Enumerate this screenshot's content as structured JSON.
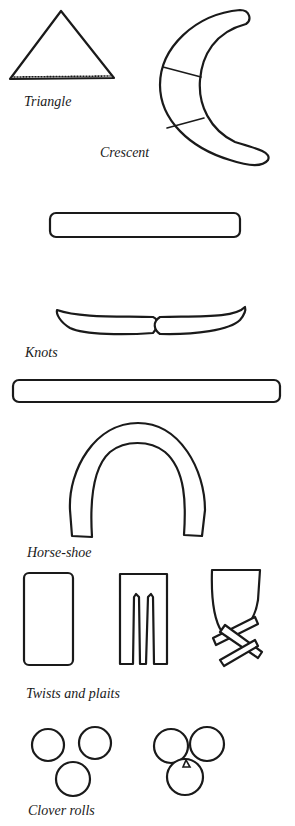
{
  "figure": {
    "labels": {
      "triangle": "Triangle",
      "crescent": "Crescent",
      "knots": "Knots",
      "horseshoe": "Horse-shoe",
      "twists": "Twists and plaits",
      "clover": "Clover rolls"
    },
    "colors": {
      "ink": "#1a1a1a",
      "background": "#ffffff"
    }
  }
}
